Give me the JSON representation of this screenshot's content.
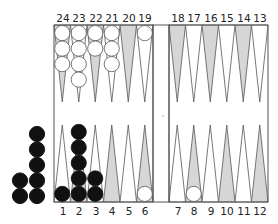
{
  "board": {
    "top_labels_left": [
      "24",
      "23",
      "22",
      "21",
      "20",
      "19"
    ],
    "top_labels_right": [
      "18",
      "17",
      "16",
      "15",
      "14",
      "13"
    ],
    "bottom_labels_left": [
      "1",
      "2",
      "3",
      "4",
      "5",
      "6"
    ],
    "bottom_labels_right": [
      "7",
      "8",
      "9",
      "10",
      "11",
      "12"
    ],
    "colors": {
      "line": "#555555",
      "shaded_point": "#d6d6d6",
      "white_checker": "#ffffff",
      "black_checker": "#111111",
      "background": "#ffffff"
    }
  },
  "position": {
    "white": {
      "24": 3,
      "23": 4,
      "22": 2,
      "21": 3,
      "19": 1,
      "6": 1,
      "8": 1
    },
    "black": {
      "1": 1,
      "2": 5,
      "3": 2
    },
    "black_borne_off_columns": [
      2,
      5
    ]
  }
}
